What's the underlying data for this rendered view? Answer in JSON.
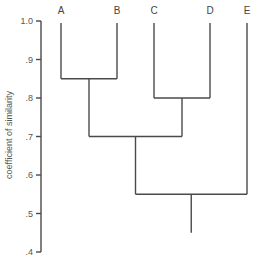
{
  "chart_data": {
    "type": "dendrogram",
    "title": "",
    "xlabel": "",
    "ylabel": "coefficient of similarity",
    "ylim": [
      0.4,
      1.0
    ],
    "yticks": [
      1.0,
      0.9,
      0.8,
      0.7,
      0.6,
      0.5,
      0.4
    ],
    "ytick_labels": [
      "1.0",
      ".9",
      ".8",
      ".7",
      ".6",
      ".5",
      ".4"
    ],
    "leaves": [
      "A",
      "B",
      "C",
      "D",
      "E"
    ],
    "merges": [
      {
        "left": "A",
        "right": "B",
        "height": 0.85
      },
      {
        "left": "C",
        "right": "D",
        "height": 0.8
      },
      {
        "left": "AB",
        "right": "CD",
        "height": 0.7
      },
      {
        "left": "ABCD",
        "right": "E",
        "height": 0.55
      }
    ],
    "root_stem_to": 0.45,
    "grid": false
  },
  "axis": {
    "title": "coefficient of similarity",
    "ticks": [
      ".4",
      ".5",
      ".6",
      ".7",
      ".8",
      ".9",
      "1.0"
    ]
  }
}
